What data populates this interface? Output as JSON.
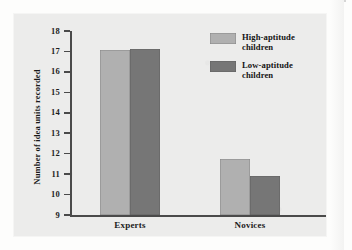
{
  "chart_data": {
    "type": "bar",
    "title": "",
    "xlabel": "",
    "ylabel": "Number of idea units recorded",
    "categories": [
      "Experts",
      "Novices"
    ],
    "ylim": [
      9,
      18
    ],
    "yticks": [
      18,
      17,
      16,
      15,
      14,
      13,
      12,
      11,
      10,
      9
    ],
    "grid": false,
    "legend_position": "top-right",
    "series": [
      {
        "name": "High-aptitude children",
        "color": "#b0b0b0",
        "values": [
          17.05,
          11.75
        ]
      },
      {
        "name": "Low-aptitude children",
        "color": "#767676",
        "values": [
          17.1,
          10.9
        ]
      }
    ]
  },
  "figure": {
    "panel_background": "#ececeb",
    "axis_color": "#4a4a4a",
    "text_color": "#1d1d1d"
  }
}
